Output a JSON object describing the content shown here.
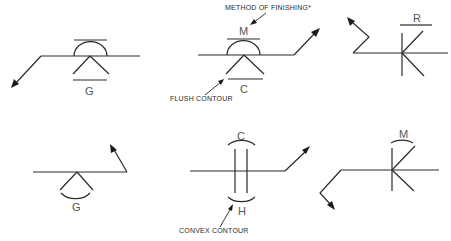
{
  "diagram": {
    "callouts": {
      "method_of_finishing": "METHOD OF FINISHING*",
      "flush_contour": "FLUSH CONTOUR",
      "convex_contour": "CONVEX CONTOUR"
    },
    "symbols": [
      {
        "id": "sym-1",
        "position": "top-left",
        "contour": "flush",
        "finish_letter": "G",
        "weld": "fillet-v with convex cap",
        "arrow": "down-left"
      },
      {
        "id": "sym-2",
        "position": "top-center",
        "contour_top": "convex",
        "finish_top": "M",
        "contour_bottom": "flush",
        "finish_bottom": "C",
        "arrow": "up-right"
      },
      {
        "id": "sym-3",
        "position": "top-right",
        "contour": "flush",
        "finish_letter": "R",
        "weld": "flare / fillet",
        "arrow": "up-left (zigzag)"
      },
      {
        "id": "sym-4",
        "position": "bottom-left",
        "contour": "convex",
        "finish_letter": "G",
        "arrow": "up-right"
      },
      {
        "id": "sym-5",
        "position": "bottom-center",
        "contour_top": "convex",
        "finish_top": "C",
        "contour_bottom": "convex",
        "finish_bottom": "H",
        "weld": "square groove",
        "arrow": "up-right"
      },
      {
        "id": "sym-6",
        "position": "bottom-right",
        "contour": "convex",
        "finish_letter": "M",
        "arrow": "down-right"
      }
    ],
    "letters": {
      "s1": "G",
      "s2_top": "M",
      "s2_bottom": "C",
      "s3": "R",
      "s4": "G",
      "s5_top": "C",
      "s5_bottom": "H",
      "s6": "M"
    }
  }
}
